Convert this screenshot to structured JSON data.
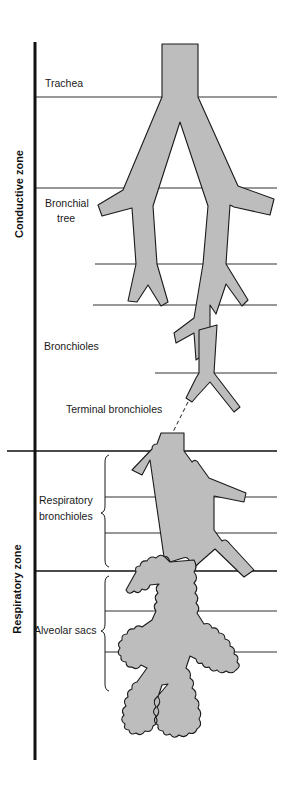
{
  "diagram": {
    "type": "anatomical-airway-diagram",
    "zones": [
      {
        "label": "Conductive zone",
        "y_range": [
          42,
          451
        ]
      },
      {
        "label": "Respiratory zone",
        "y_range": [
          451,
          760
        ]
      }
    ],
    "labels": {
      "trachea": "Trachea",
      "bronchial_tree_line1": "Bronchial",
      "bronchial_tree_line2": "tree",
      "bronchioles": "Bronchioles",
      "terminal_bronchioles": "Terminal bronchioles",
      "respiratory_bronchioles_line1": "Respiratory",
      "respiratory_bronchioles_line2": "bronchioles",
      "alveolar_sacs": "Alveolar sacs"
    },
    "colors": {
      "airway_fill": "#bdbdbd",
      "outline": "#1a1a1a",
      "background": "#ffffff"
    }
  }
}
